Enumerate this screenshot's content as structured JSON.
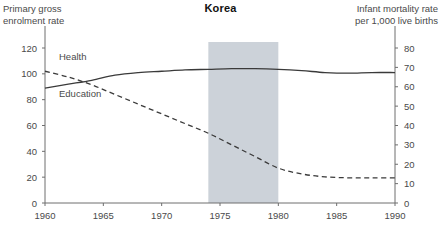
{
  "title": "Korea",
  "left_axis_title": "Primary gross\nenrolment rate",
  "right_axis_title": "Infant mortality rate\nper 1,000 live births",
  "series_labels": {
    "health": "Health",
    "education": "Education"
  },
  "colors": {
    "line": "#3a3a3a",
    "axis": "#6e6e6e",
    "band": "#ccd2d9",
    "text": "#4a4a4a",
    "title": "#111111",
    "background": "#ffffff"
  },
  "chart_data": {
    "type": "line",
    "title": "Korea",
    "xlabel": "",
    "ylabel": "Primary gross enrolment rate",
    "y2label": "Infant mortality rate per 1,000 live births",
    "xlim": [
      1960,
      1990
    ],
    "ylim": [
      0,
      120
    ],
    "y2lim": [
      0,
      80
    ],
    "xticks": [
      1960,
      1965,
      1970,
      1975,
      1980,
      1985,
      1990
    ],
    "xticklabels": [
      "1960",
      "1965",
      "1970",
      "1975",
      "1980",
      "1985",
      "1990"
    ],
    "yticks": [
      0,
      20,
      40,
      60,
      80,
      100,
      120
    ],
    "yticklabels": [
      "0",
      "20",
      "40",
      "60",
      "80",
      "100",
      "120"
    ],
    "y2ticks": [
      0,
      10,
      20,
      30,
      40,
      50,
      60,
      70,
      80
    ],
    "y2ticklabels": [
      "0",
      "10",
      "20",
      "30",
      "40",
      "50",
      "60",
      "70",
      "80"
    ],
    "grid": false,
    "legend": "inline-annotations",
    "annotations": [
      {
        "text": "Health",
        "x": 1961.2,
        "y2": 74,
        "series": "health"
      },
      {
        "text": "Education",
        "x": 1961.2,
        "y": 82,
        "series": "education"
      }
    ],
    "shaded_band": {
      "x0": 1974,
      "x1": 1980,
      "color": "#ccd2d9",
      "label": ""
    },
    "series": [
      {
        "name": "Education",
        "axis": "left",
        "style": "solid",
        "x": [
          1960,
          1962,
          1964,
          1966,
          1968,
          1970,
          1972,
          1974,
          1976,
          1978,
          1980,
          1982,
          1984,
          1986,
          1988,
          1990
        ],
        "values": [
          89,
          92,
          95,
          99,
          101,
          102,
          103,
          103.5,
          104,
          104,
          103.5,
          102.5,
          101,
          100.5,
          101,
          101
        ]
      },
      {
        "name": "Health",
        "axis": "right",
        "style": "dashed",
        "x": [
          1960,
          1962,
          1964,
          1966,
          1968,
          1970,
          1972,
          1974,
          1976,
          1978,
          1980,
          1982,
          1984,
          1986,
          1988,
          1990
        ],
        "values": [
          68,
          65,
          61,
          56,
          51,
          46,
          41,
          36,
          30,
          24,
          18,
          15,
          13.5,
          13,
          13,
          13
        ]
      }
    ]
  }
}
